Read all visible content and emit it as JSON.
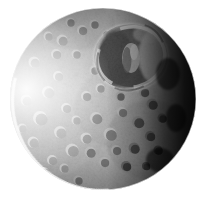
{
  "image": {
    "subject": "Mimas",
    "subject_type": "moon",
    "alt_text": "Grayscale photograph of Saturn's moon Mimas showing the large Herschel impact crater",
    "background_color": "#ffffff",
    "width": 205,
    "height": 198,
    "color_mode": "grayscale"
  },
  "scene": {
    "disk": {
      "center_x": 103,
      "center_y": 99,
      "radius_x": 93,
      "radius_y": 91,
      "left_edge": 10,
      "right_edge": 196,
      "top_edge": 8,
      "bottom_edge": 190
    },
    "lighting": {
      "illumination_direction": "left",
      "terminator_side": "right",
      "limb_highlight_color": "#fbfbfb",
      "shadow_color": "#050505"
    },
    "surface": {
      "base_light_tone": "#d8d8d8",
      "mid_tone": "#9a9a9a",
      "dark_tone": "#3a3a3a",
      "heavily_cratered": true
    },
    "features": [
      {
        "name": "Herschel crater",
        "center_x": 131,
        "center_y": 57,
        "radius": 36,
        "rim_tone": "#e6e6e6",
        "floor_tone": "#4a4a4a",
        "has_central_peak": true,
        "peak_x": 130,
        "peak_y": 60,
        "peak_tone": "#c8c8c8"
      },
      {
        "name": "northern limb terrain",
        "center_x": 78,
        "center_y": 28,
        "radius": 34,
        "tone": "#a8a8a8"
      },
      {
        "name": "southwest bright plains",
        "center_x": 52,
        "center_y": 132,
        "radius": 44,
        "tone": "#e2e2e2"
      },
      {
        "name": "southeast shadowed cratered terrain",
        "center_x": 148,
        "center_y": 136,
        "radius": 42,
        "tone": "#2e2e2e"
      },
      {
        "name": "terminator shadow band",
        "center_x": 182,
        "center_y": 92,
        "radius": 48,
        "tone": "#060606"
      }
    ]
  }
}
